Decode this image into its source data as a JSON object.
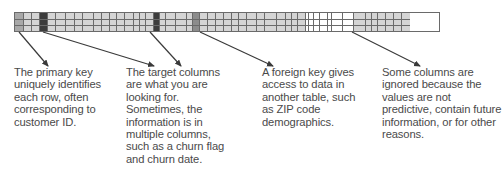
{
  "diagram": {
    "title": "",
    "table": {
      "rows": 3,
      "colors": {
        "normal": "#d4d4d4",
        "primary_key": "#a8a8a8",
        "target": "#3c3c3c",
        "foreign_key": "#8c8c8c",
        "ignored": "#ffffff",
        "grid": "#6a6a6a"
      },
      "columns": [
        {
          "w": 9,
          "type": "primary_key"
        },
        {
          "w": 8,
          "type": "normal"
        },
        {
          "w": 8,
          "type": "normal"
        },
        {
          "w": 8,
          "type": "target"
        },
        {
          "w": 8,
          "type": "normal"
        },
        {
          "w": 10,
          "type": "normal"
        },
        {
          "w": 9,
          "type": "normal"
        },
        {
          "w": 8,
          "type": "normal"
        },
        {
          "w": 11,
          "type": "normal"
        },
        {
          "w": 8,
          "type": "normal"
        },
        {
          "w": 8,
          "type": "normal"
        },
        {
          "w": 7,
          "type": "normal"
        },
        {
          "w": 8,
          "type": "normal"
        },
        {
          "w": 9,
          "type": "normal"
        },
        {
          "w": 6,
          "type": "normal"
        },
        {
          "w": 6,
          "type": "normal"
        },
        {
          "w": 8,
          "type": "normal"
        },
        {
          "w": 6,
          "type": "target"
        },
        {
          "w": 6,
          "type": "normal"
        },
        {
          "w": 10,
          "type": "normal"
        },
        {
          "w": 11,
          "type": "normal"
        },
        {
          "w": 6,
          "type": "normal"
        },
        {
          "w": 7,
          "type": "foreign_key"
        },
        {
          "w": 8,
          "type": "normal"
        },
        {
          "w": 8,
          "type": "normal"
        },
        {
          "w": 8,
          "type": "normal"
        },
        {
          "w": 8,
          "type": "normal"
        },
        {
          "w": 7,
          "type": "normal"
        },
        {
          "w": 8,
          "type": "normal"
        },
        {
          "w": 10,
          "type": "normal"
        },
        {
          "w": 8,
          "type": "normal"
        },
        {
          "w": 12,
          "type": "normal"
        },
        {
          "w": 9,
          "type": "normal"
        },
        {
          "w": 6,
          "type": "normal"
        },
        {
          "w": 6,
          "type": "normal"
        },
        {
          "w": 8,
          "type": "normal"
        },
        {
          "w": 3,
          "type": "ignored"
        },
        {
          "w": 5,
          "type": "ignored"
        },
        {
          "w": 6,
          "type": "ignored"
        },
        {
          "w": 8,
          "type": "ignored"
        },
        {
          "w": 4,
          "type": "ignored"
        },
        {
          "w": 11,
          "type": "ignored"
        },
        {
          "w": 11,
          "type": "ignored"
        },
        {
          "w": 12,
          "type": "normal"
        },
        {
          "w": 6,
          "type": "normal"
        },
        {
          "w": 6,
          "type": "normal"
        },
        {
          "w": 8,
          "type": "normal"
        },
        {
          "w": 8,
          "type": "normal"
        },
        {
          "w": 8,
          "type": "normal"
        },
        {
          "w": 8,
          "type": "normal"
        }
      ]
    },
    "arrows": [
      {
        "from": [
          19,
          32
        ],
        "to": [
          48,
          66
        ],
        "label": "primary-key-arrow"
      },
      {
        "from": [
          43,
          32
        ],
        "to": [
          154,
          66
        ],
        "label": "target-column-arrow-1"
      },
      {
        "from": [
          150,
          32
        ],
        "to": [
          181,
          66
        ],
        "label": "target-column-arrow-2"
      },
      {
        "from": [
          200,
          32
        ],
        "to": [
          273,
          66
        ],
        "label": "foreign-key-arrow"
      },
      {
        "from": [
          352,
          32
        ],
        "to": [
          420,
          66
        ],
        "label": "ignored-columns-arrow"
      }
    ],
    "notes": [
      {
        "x": 14,
        "width": 108,
        "text": "The primary key uniquely identifies each row, often corresponding to customer ID."
      },
      {
        "x": 126,
        "width": 108,
        "text": "The target columns are what you are looking for. Sometimes, the information is in multiple columns, such as a churn flag and churn date."
      },
      {
        "x": 262,
        "width": 104,
        "text": "A foreign key gives access to data in another table, such as ZIP code demographics."
      },
      {
        "x": 382,
        "width": 120,
        "text": "Some columns are ignored because the values are not predictive, contain future information, or for other reasons."
      }
    ]
  }
}
